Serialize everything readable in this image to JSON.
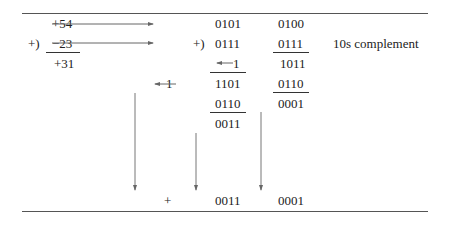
{
  "left_column": {
    "row1": "+54",
    "row2_op": "+)",
    "row2": "−23",
    "result": "+31"
  },
  "middle_column": {
    "op": "+)",
    "rows": [
      "0101",
      "0111",
      "1",
      "1101",
      "0110",
      "0011"
    ],
    "carry_in": "1",
    "end_around_carry": "1"
  },
  "right_column": {
    "rows": [
      "0100",
      "0111",
      "1011",
      "0110",
      "0001"
    ]
  },
  "annotation": "10s complement",
  "final_result": {
    "sign": "+",
    "high": "0011",
    "low": "0001"
  },
  "colors": {
    "text": "#222222",
    "lines": "#555555",
    "arrows": "#666666"
  }
}
